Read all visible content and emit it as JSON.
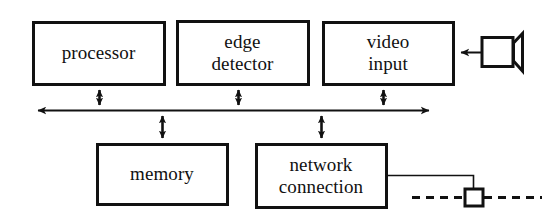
{
  "diagram": {
    "background_color": "#ffffff",
    "line_color": "#111111",
    "blocks": [
      {
        "id": "processor",
        "label": "processor",
        "x": 33,
        "y": 22,
        "w": 131,
        "h": 62
      },
      {
        "id": "edge-detector",
        "label": "edge\ndetector",
        "x": 177,
        "y": 21,
        "w": 131,
        "h": 63
      },
      {
        "id": "video-input",
        "label": "video\ninput",
        "x": 323,
        "y": 22,
        "w": 130,
        "h": 62
      },
      {
        "id": "memory",
        "label": "memory",
        "x": 97,
        "y": 144,
        "w": 130,
        "h": 60
      },
      {
        "id": "network-connection",
        "label": "network\nconnection",
        "x": 256,
        "y": 144,
        "w": 130,
        "h": 63
      }
    ],
    "bus": {
      "label": "system bus",
      "y": 110,
      "x_start": 30,
      "x_end": 437,
      "arrow_left": true,
      "arrow_right": true
    },
    "connections": [
      {
        "id": "processor-to-bus",
        "from": "processor",
        "to": "bus",
        "x": 99,
        "y_top": 84,
        "y_bottom": 110,
        "double_headed": true
      },
      {
        "id": "edge-detector-to-bus",
        "from": "edge-detector",
        "to": "bus",
        "x": 238,
        "y_top": 84,
        "y_bottom": 110,
        "double_headed": true
      },
      {
        "id": "video-input-to-bus",
        "from": "video-input",
        "to": "bus",
        "x": 383,
        "y_top": 84,
        "y_bottom": 110,
        "double_headed": true
      },
      {
        "id": "bus-to-memory",
        "from": "bus",
        "to": "memory",
        "x": 162,
        "y_top": 110,
        "y_bottom": 144,
        "double_headed": true
      },
      {
        "id": "bus-to-network-connection",
        "from": "bus",
        "to": "network-connection",
        "x": 321,
        "y_top": 110,
        "y_bottom": 144,
        "double_headed": true
      },
      {
        "id": "camera-to-video-input",
        "from": "camera",
        "to": "video-input",
        "arrow": "left",
        "x_start": 480,
        "x_end": 455,
        "y": 52
      }
    ],
    "camera": {
      "id": "camera",
      "label": "camera",
      "body": {
        "x": 481,
        "y": 37,
        "w": 32,
        "h": 30
      },
      "lens": {
        "x": 513,
        "y": 33,
        "w": 10,
        "h": 38
      }
    },
    "network_cable": {
      "id": "network-cable",
      "segment_horizontal": {
        "x_start": 386,
        "x_end": 473,
        "y": 175
      },
      "segment_vertical": {
        "x": 473,
        "y_start": 175,
        "y_end": 197
      },
      "connector": {
        "x": 464,
        "y": 188,
        "w": 20,
        "h": 18
      },
      "dash_left": {
        "x_start": 412,
        "x_end": 464,
        "y": 197
      },
      "dash_right": {
        "x_start": 484,
        "x_end": 542,
        "y": 197
      }
    }
  }
}
